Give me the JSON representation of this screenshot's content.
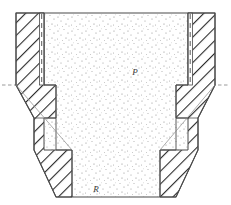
{
  "figure": {
    "type": "engineering-section-view",
    "canvas": {
      "width": 231,
      "height": 205
    },
    "background_color": "#ffffff",
    "line_color": "#4a4a4a",
    "hatch_color": "#2b2b2b",
    "stipple_color": "#8a8a8a",
    "centerline_color": "#9a9a9a"
  },
  "labels": {
    "pressure": "P",
    "radius": "R"
  },
  "label_positions": {
    "pressure": {
      "x": 135,
      "y": 75
    },
    "radius": {
      "x": 96,
      "y": 192
    }
  },
  "regions": {
    "left_wall": "hatched-die-wall-left",
    "right_wall": "hatched-die-wall-right",
    "core": "stippled-material-core",
    "left_channel": "narrow-vertical-channel-left",
    "right_channel": "narrow-vertical-channel-right"
  },
  "centerlines": {
    "horizontal_y": 85,
    "vertical_x": 116
  },
  "geometry": {
    "top_y": 13,
    "bottom_y": 197,
    "outer_left_x": 16,
    "outer_right_x": 215,
    "core_left_x": 44,
    "core_right_x": 188,
    "step_y": 85,
    "lower_step_y": 150,
    "bottom_left_x": 72,
    "bottom_right_x": 160
  }
}
